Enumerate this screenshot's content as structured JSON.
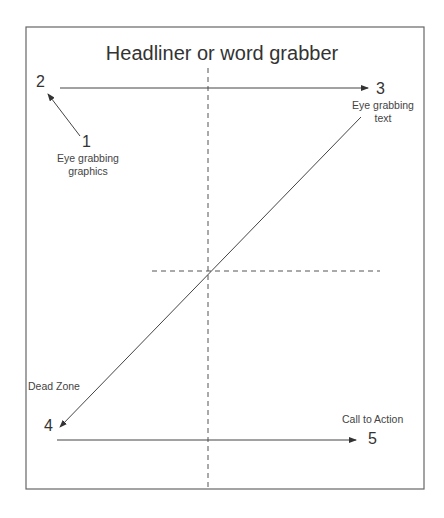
{
  "title": "Headliner or word grabber",
  "points": {
    "p1": {
      "num": "1",
      "label1": "Eye grabbing",
      "label2": "graphics"
    },
    "p2": {
      "num": "2"
    },
    "p3": {
      "num": "3",
      "label1": "Eye grabbing",
      "label2": "text"
    },
    "p4": {
      "num": "4",
      "label": "Dead Zone"
    },
    "p5": {
      "num": "5",
      "label": "Call to Action"
    }
  },
  "colors": {
    "border": "#666666",
    "line": "#444444",
    "text": "#333333"
  }
}
